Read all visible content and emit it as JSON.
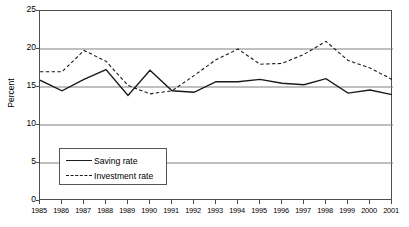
{
  "chart_data": {
    "type": "line",
    "title": "",
    "xlabel": "",
    "ylabel": "Percent",
    "ylim": [
      0,
      25
    ],
    "yticks": [
      0,
      5,
      10,
      15,
      20,
      25
    ],
    "grid": true,
    "legend_position": "inside-lower-left",
    "categories": [
      "1985",
      "1986",
      "1987",
      "1988",
      "1989",
      "1990",
      "1991",
      "1992",
      "1993",
      "1994",
      "1995",
      "1996",
      "1997",
      "1998",
      "1999",
      "2000",
      "2001"
    ],
    "series": [
      {
        "name": "Saving rate",
        "style": "solid",
        "color": "#1a1a1a",
        "values": [
          15.9,
          14.5,
          16.0,
          17.3,
          13.9,
          17.2,
          14.5,
          14.3,
          15.7,
          15.7,
          16.0,
          15.5,
          15.3,
          16.1,
          14.2,
          14.6,
          14.0
        ]
      },
      {
        "name": "Investment rate",
        "style": "dashed",
        "color": "#1a1a1a",
        "values": [
          17.0,
          17.0,
          19.8,
          18.4,
          15.2,
          14.1,
          14.5,
          16.5,
          18.6,
          20.0,
          18.0,
          18.1,
          19.3,
          21.0,
          18.5,
          17.5,
          16.0
        ]
      }
    ]
  },
  "legend": {
    "items": [
      {
        "label": "Saving rate",
        "style": "solid"
      },
      {
        "label": "Investment rate",
        "style": "dashed"
      }
    ]
  },
  "axis": {
    "y_title": "Percent",
    "y_tick_labels": [
      "25",
      "20",
      "15",
      "10",
      "5",
      "0"
    ],
    "x_tick_labels": [
      "1985",
      "1986",
      "1987",
      "1988",
      "1989",
      "1990",
      "1991",
      "1992",
      "1993",
      "1994",
      "1995",
      "1996",
      "1997",
      "1998",
      "1999",
      "2000",
      "2001"
    ]
  },
  "colors": {
    "axis": "#4d4d4d",
    "grid": "#808080",
    "line": "#1a1a1a",
    "background": "#ffffff"
  }
}
